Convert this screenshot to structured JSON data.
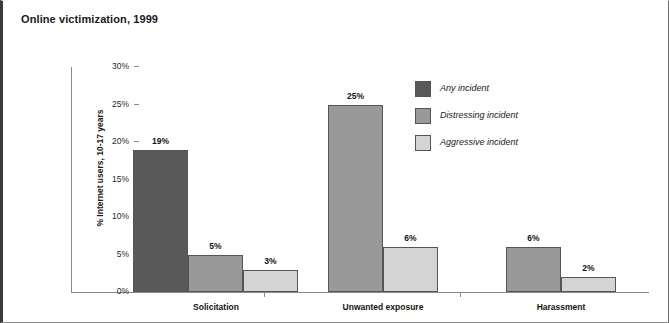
{
  "chart_data": {
    "type": "bar",
    "title": "Online victimization, 1999",
    "xlabel": "",
    "ylabel": "% Internet users, 10-17 years",
    "ylim": [
      0,
      30
    ],
    "ytick_labels": [
      "0%",
      "5%",
      "10%",
      "15%",
      "20%",
      "25%",
      "30%"
    ],
    "ytick_values": [
      0,
      5,
      10,
      15,
      20,
      25,
      30
    ],
    "grid": false,
    "legend_position": "upper right",
    "categories": [
      "Solicitation",
      "Unwanted exposure",
      "Harassment"
    ],
    "series": [
      {
        "name": "Any incident",
        "color": "#595959",
        "values": [
          19,
          null,
          null
        ],
        "labels": [
          "19%",
          "",
          ""
        ]
      },
      {
        "name": "Distressing incident",
        "color": "#999999",
        "values": [
          5,
          25,
          6
        ],
        "labels": [
          "5%",
          "25%",
          "6%"
        ]
      },
      {
        "name": "Aggressive incident",
        "color": "#d4d4d4",
        "values": [
          3,
          6,
          2
        ],
        "labels": [
          "3%",
          "6%",
          "2%"
        ]
      }
    ],
    "bars": [
      {
        "group": "Solicitation",
        "series": "Any incident",
        "value": 19,
        "label": "19%"
      },
      {
        "group": "Solicitation",
        "series": "Distressing incident",
        "value": 5,
        "label": "5%"
      },
      {
        "group": "Solicitation",
        "series": "Aggressive incident",
        "value": 3,
        "label": "3%"
      },
      {
        "group": "Unwanted exposure",
        "series": "Distressing incident",
        "value": 25,
        "label": "25%"
      },
      {
        "group": "Unwanted exposure",
        "series": "Aggressive incident",
        "value": 6,
        "label": "6%"
      },
      {
        "group": "Harassment",
        "series": "Distressing incident",
        "value": 6,
        "label": "6%"
      },
      {
        "group": "Harassment",
        "series": "Aggressive incident",
        "value": 2,
        "label": "2%"
      }
    ]
  },
  "axis": {
    "ticks": [
      {
        "label": "30%",
        "value": 30
      },
      {
        "label": "25%",
        "value": 25
      },
      {
        "label": "20%",
        "value": 20
      },
      {
        "label": "15%",
        "value": 15
      },
      {
        "label": "10%",
        "value": 10
      },
      {
        "label": "5%",
        "value": 5
      },
      {
        "label": "0%",
        "value": 0
      }
    ],
    "y_title": "% Internet users, 10-17 years"
  },
  "legend": {
    "items": [
      {
        "label": "Any incident",
        "color": "#595959"
      },
      {
        "label": "Distressing incident",
        "color": "#999999"
      },
      {
        "label": "Aggressive incident",
        "color": "#d4d4d4"
      }
    ]
  },
  "groups": [
    {
      "label": "Solicitation"
    },
    {
      "label": "Unwanted exposure"
    },
    {
      "label": "Harassment"
    }
  ],
  "colors": {
    "any_incident": "#595959",
    "distressing_incident": "#999999",
    "aggressive_incident": "#d4d4d4",
    "axis": "#8c8c8c",
    "text": "#141414",
    "frame": "#3a3a3a"
  }
}
